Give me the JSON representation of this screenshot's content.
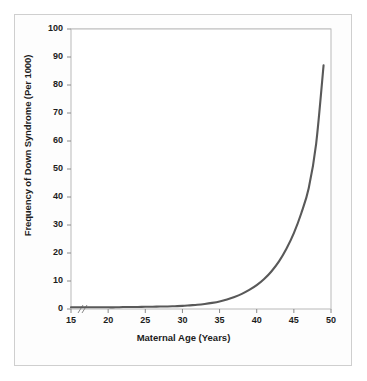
{
  "chart_data": {
    "type": "line",
    "title": "",
    "xlabel": "Maternal Age (Years)",
    "ylabel": "Frequency of Down Syndrome (Per 1000)",
    "xlim": [
      15,
      50
    ],
    "ylim": [
      0,
      100
    ],
    "xticks": [
      15,
      20,
      25,
      30,
      35,
      40,
      45,
      50
    ],
    "yticks": [
      0,
      10,
      20,
      30,
      40,
      50,
      60,
      70,
      80,
      90,
      100
    ],
    "grid": "horizontal",
    "legend": "none",
    "axis_break": "//",
    "series": [
      {
        "name": "Frequency of Down Syndrome",
        "color": "#595959",
        "x": [
          15,
          16,
          17,
          18,
          19,
          20,
          21,
          22,
          23,
          24,
          25,
          26,
          27,
          28,
          29,
          30,
          31,
          32,
          33,
          34,
          35,
          36,
          37,
          38,
          39,
          40,
          41,
          42,
          43,
          44,
          45,
          46,
          47,
          48,
          49
        ],
        "values": [
          0.6,
          0.6,
          0.6,
          0.6,
          0.6,
          0.6,
          0.6,
          0.7,
          0.7,
          0.7,
          0.8,
          0.8,
          0.9,
          0.9,
          1.0,
          1.1,
          1.3,
          1.5,
          1.8,
          2.2,
          2.7,
          3.4,
          4.3,
          5.4,
          6.8,
          8.5,
          10.7,
          13.5,
          17.0,
          21.5,
          27.1,
          34.2,
          43.1,
          59.0,
          87.0
        ]
      }
    ]
  },
  "axis": {
    "ylabel_text": "Frequency of Down Syndrome (Per 1000)",
    "xlabel_text": "Maternal Age (Years)",
    "break_mark": "//"
  }
}
